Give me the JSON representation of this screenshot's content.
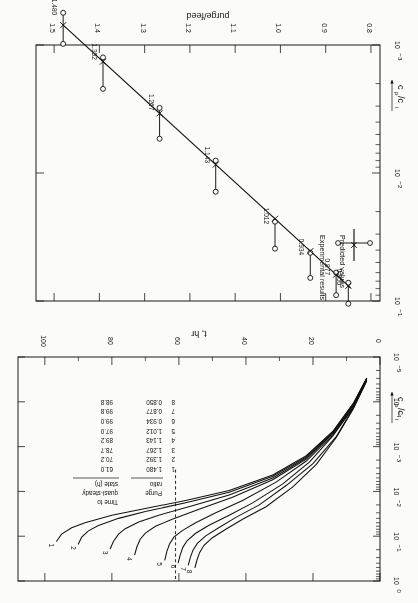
{
  "figure": {
    "orientation_note": "page scanned upside down",
    "background_color": "#fbfbfa",
    "ink_color": "#111111"
  },
  "top_panel": {
    "y_axis": {
      "label": "cp/ci",
      "tick_labels": [
        "10^0",
        "10^-1",
        "10^-2",
        "10^-3",
        "10^-4",
        "10^-5"
      ],
      "decades": [
        0,
        -1,
        -2,
        -3,
        -4,
        -5
      ]
    },
    "x_axis": {
      "label": "t, hr",
      "tick_labels": [
        "0",
        "20",
        "40",
        "60",
        "80",
        "100"
      ],
      "ticks": [
        0,
        20,
        40,
        60,
        80,
        100
      ],
      "range": [
        0,
        108
      ]
    },
    "curve_labels": [
      "1",
      "2",
      "3",
      "4",
      "5",
      "6",
      "7",
      "8"
    ],
    "dashed_line_at_t": 61.0,
    "table": {
      "col1_header": "Purge ratio",
      "col1_header_line1": "Purge",
      "col1_header_line2": "ratio",
      "col2_header": "Time to quasi-steady state (h)",
      "col2_header_line1": "Time to",
      "col2_header_line2": "quasi-steady",
      "col2_header_line3": "state (h)",
      "rows": [
        {
          "n": "1",
          "purge_ratio": "1.480",
          "time_to_qss": "61.0"
        },
        {
          "n": "2",
          "purge_ratio": "1.392",
          "time_to_qss": "70.2"
        },
        {
          "n": "3",
          "purge_ratio": "1.267",
          "time_to_qss": "78.7"
        },
        {
          "n": "4",
          "purge_ratio": "1.143",
          "time_to_qss": "89.2"
        },
        {
          "n": "5",
          "purge_ratio": "1.012",
          "time_to_qss": "97.0"
        },
        {
          "n": "6",
          "purge_ratio": "0.934",
          "time_to_qss": "99.0"
        },
        {
          "n": "7",
          "purge_ratio": "0.877",
          "time_to_qss": "99.8"
        },
        {
          "n": "8",
          "purge_ratio": "0.850",
          "time_to_qss": "98.8"
        }
      ]
    }
  },
  "bottom_panel": {
    "y_axis": {
      "label": "cp/ci",
      "tick_labels": [
        "10^-1",
        "10^-2",
        "10^-3"
      ],
      "decades": [
        -1,
        -2,
        -3
      ]
    },
    "x_axis": {
      "label": "purge/feed",
      "tick_labels": [
        "0.8",
        "0.9",
        "1.0",
        "1.1",
        "1.2",
        "1.3",
        "1.4",
        "1.5"
      ],
      "ticks": [
        0.8,
        0.9,
        1.0,
        1.1,
        1.2,
        1.3,
        1.4,
        1.5
      ],
      "range": [
        0.78,
        1.54
      ]
    },
    "legend": {
      "experimental_label": "Experimental results",
      "predicted_label": "Predicted values"
    },
    "point_labels": [
      "0.850",
      "0.877",
      "0.934",
      "1.012",
      "1.143",
      "1.267",
      "1.392",
      "1.480"
    ]
  },
  "chart_data": [
    {
      "type": "line",
      "id": "top-panel",
      "title": "",
      "xlabel": "t, hr",
      "ylabel": "cp/ci",
      "xlim": [
        0,
        108
      ],
      "ylim_log10": [
        -5,
        0
      ],
      "yscale": "log",
      "grid": false,
      "legend": "none",
      "annotations": [
        "dashed vertical line at t = 61 hr"
      ],
      "series": [
        {
          "name": "1",
          "purge_ratio": 1.48,
          "time_to_quasi_steady_h": 61.0,
          "x": [
            4,
            8,
            14,
            22,
            32,
            45,
            58,
            70,
            80,
            88,
            92,
            95,
            96.5
          ],
          "y": [
            3e-05,
            0.00011,
            0.00045,
            0.0016,
            0.0043,
            0.0095,
            0.016,
            0.024,
            0.034,
            0.05,
            0.065,
            0.09,
            0.13
          ]
        },
        {
          "name": "2",
          "purge_ratio": 1.392,
          "time_to_quasi_steady_h": 70.2,
          "x": [
            4,
            8,
            14,
            22,
            32,
            45,
            58,
            70,
            78,
            84,
            87,
            89,
            90
          ],
          "y": [
            3e-05,
            0.00011,
            0.00046,
            0.0017,
            0.0046,
            0.0105,
            0.018,
            0.028,
            0.04,
            0.058,
            0.076,
            0.105,
            0.15
          ]
        },
        {
          "name": "3",
          "purge_ratio": 1.267,
          "time_to_quasi_steady_h": 78.7,
          "x": [
            4,
            8,
            14,
            22,
            32,
            45,
            56,
            66,
            72,
            76,
            78,
            79.5,
            80.5
          ],
          "y": [
            3e-05,
            0.00012,
            0.00048,
            0.0018,
            0.005,
            0.012,
            0.021,
            0.034,
            0.048,
            0.068,
            0.09,
            0.13,
            0.19
          ]
        },
        {
          "name": "4",
          "purge_ratio": 1.143,
          "time_to_quasi_steady_h": 89.2,
          "x": [
            4,
            8,
            14,
            22,
            32,
            44,
            54,
            62,
            67,
            70,
            71.5,
            72.5,
            73.2
          ],
          "y": [
            3.1e-05,
            0.00012,
            0.0005,
            0.0019,
            0.0055,
            0.0135,
            0.025,
            0.042,
            0.06,
            0.085,
            0.115,
            0.17,
            0.26
          ]
        },
        {
          "name": "5",
          "purge_ratio": 1.012,
          "time_to_quasi_steady_h": 97.0,
          "x": [
            4,
            8,
            14,
            22,
            31,
            41,
            49,
            55,
            59,
            61.5,
            62.8,
            63.6,
            64.2
          ],
          "y": [
            3.2e-05,
            0.00013,
            0.00054,
            0.0021,
            0.0062,
            0.016,
            0.03,
            0.05,
            0.075,
            0.105,
            0.15,
            0.22,
            0.34
          ]
        },
        {
          "name": "6",
          "purge_ratio": 0.934,
          "time_to_quasi_steady_h": 99.0,
          "x": [
            4,
            8,
            14,
            21,
            29,
            38,
            45,
            51,
            55,
            57.5,
            58.8,
            59.6,
            60.2
          ],
          "y": [
            3.3e-05,
            0.000135,
            0.00057,
            0.0022,
            0.0068,
            0.018,
            0.034,
            0.057,
            0.086,
            0.125,
            0.175,
            0.26,
            0.39
          ]
        },
        {
          "name": "7",
          "purge_ratio": 0.877,
          "time_to_quasi_steady_h": 99.8,
          "x": [
            4,
            8,
            13,
            20,
            28,
            36,
            43,
            48,
            52,
            54.5,
            55.8,
            56.6,
            57.2
          ],
          "y": [
            3.4e-05,
            0.00014,
            0.00059,
            0.0024,
            0.0074,
            0.02,
            0.038,
            0.064,
            0.098,
            0.145,
            0.205,
            0.3,
            0.44
          ]
        },
        {
          "name": "8",
          "purge_ratio": 0.85,
          "time_to_quasi_steady_h": 98.8,
          "x": [
            4,
            8,
            13,
            19,
            26,
            34,
            41,
            46,
            50,
            52.5,
            53.8,
            54.6,
            55.2
          ],
          "y": [
            3.5e-05,
            0.000145,
            0.00062,
            0.0025,
            0.0079,
            0.022,
            0.042,
            0.07,
            0.108,
            0.16,
            0.23,
            0.34,
            0.5
          ]
        }
      ]
    },
    {
      "type": "scatter",
      "id": "bottom-panel",
      "title": "",
      "xlabel": "purge/feed",
      "ylabel": "cp/ci",
      "xlim": [
        0.78,
        1.54
      ],
      "ylim_log10": [
        -3,
        -1
      ],
      "yscale": "log",
      "grid": false,
      "legend_position": "upper-left",
      "legend_entries": [
        "Experimental results",
        "Predicted values"
      ],
      "predicted_line": {
        "x": [
          0.845,
          1.48
        ],
        "y": [
          0.079,
          0.0007
        ]
      },
      "points": [
        {
          "label": "0.850",
          "x": 0.85,
          "y": 0.084,
          "err_low": 0.072,
          "err_high": 0.105
        },
        {
          "label": "0.877",
          "x": 0.877,
          "y": 0.072,
          "err_low": 0.06,
          "err_high": 0.09
        },
        {
          "label": "0.934",
          "x": 0.934,
          "y": 0.052,
          "err_low": 0.042,
          "err_high": 0.066
        },
        {
          "label": "1.012",
          "x": 1.012,
          "y": 0.03,
          "err_low": 0.024,
          "err_high": 0.039
        },
        {
          "label": "1.143",
          "x": 1.143,
          "y": 0.0105,
          "err_low": 0.008,
          "err_high": 0.014
        },
        {
          "label": "1.267",
          "x": 1.267,
          "y": 0.004,
          "err_low": 0.0031,
          "err_high": 0.0054
        },
        {
          "label": "1.392",
          "x": 1.392,
          "y": 0.0016,
          "err_low": 0.00125,
          "err_high": 0.0022
        },
        {
          "label": "1.480",
          "x": 1.48,
          "y": 0.00072,
          "err_low": 0.00056,
          "err_high": 0.00098
        }
      ]
    }
  ]
}
